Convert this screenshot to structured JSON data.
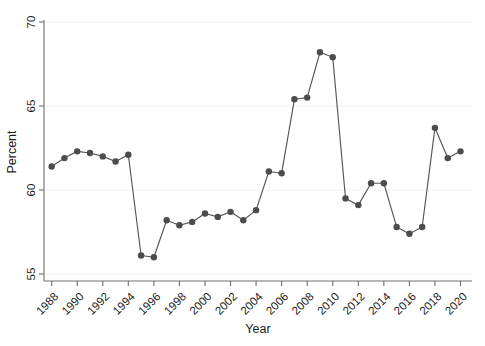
{
  "chart_data": {
    "type": "line",
    "title": "",
    "subtitle": "",
    "xlabel": "Year",
    "ylabel": "Percent",
    "xlim": [
      1987.4,
      2020.9
    ],
    "ylim": [
      55,
      70
    ],
    "grid": false,
    "legend": null,
    "marker": "filled-circle",
    "marker_color": "#4c4c4c",
    "line_color": "#555555",
    "xticks": [
      1988,
      1990,
      1992,
      1994,
      1996,
      1998,
      2000,
      2002,
      2004,
      2006,
      2008,
      2010,
      2012,
      2014,
      2016,
      2018,
      2020
    ],
    "xtick_labels": [
      "1988",
      "1990",
      "1992",
      "1994",
      "1996",
      "1998",
      "2000",
      "2002",
      "2004",
      "2006",
      "2008",
      "2010",
      "2012",
      "2014",
      "2016",
      "2018",
      "2020"
    ],
    "yticks": [
      55,
      60,
      65,
      70
    ],
    "ytick_labels": [
      "55",
      "60",
      "65",
      "70"
    ],
    "x": [
      1988,
      1989,
      1990,
      1991,
      1992,
      1993,
      1994,
      1995,
      1996,
      1997,
      1998,
      1999,
      2000,
      2001,
      2002,
      2003,
      2004,
      2005,
      2006,
      2007,
      2008,
      2009,
      2010,
      2011,
      2012,
      2013,
      2014,
      2015,
      2016,
      2017,
      2018,
      2019,
      2020
    ],
    "values": [
      61.4,
      61.9,
      62.3,
      62.2,
      62.0,
      61.7,
      62.1,
      56.1,
      56.0,
      58.2,
      57.9,
      58.1,
      58.6,
      58.4,
      58.7,
      58.2,
      58.8,
      61.1,
      61.0,
      65.4,
      65.5,
      68.2,
      67.9,
      59.5,
      59.1,
      60.4,
      60.4,
      57.8,
      57.4,
      57.8,
      63.7,
      61.9,
      62.3
    ],
    "series": [
      {
        "name": "Percent",
        "values": [
          61.4,
          61.9,
          62.3,
          62.2,
          62.0,
          61.7,
          62.1,
          56.1,
          56.0,
          58.2,
          57.9,
          58.1,
          58.6,
          58.4,
          58.7,
          58.2,
          58.8,
          61.1,
          61.0,
          65.4,
          65.5,
          68.2,
          67.9,
          59.5,
          59.1,
          60.4,
          60.4,
          57.8,
          57.4,
          57.8,
          63.7,
          61.9,
          62.3
        ]
      }
    ]
  }
}
